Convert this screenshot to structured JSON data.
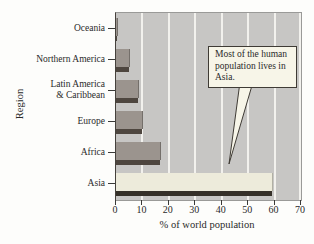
{
  "chart_data": {
    "type": "bar",
    "orientation": "horizontal",
    "title": "",
    "xlabel": "% of world population",
    "ylabel": "Region",
    "xlim": [
      0,
      70
    ],
    "xticks": [
      0,
      10,
      20,
      30,
      40,
      50,
      60,
      70
    ],
    "grid": true,
    "legend": false,
    "categories": [
      "Oceania",
      "Northern America",
      "Latin America\n& Caribbean",
      "Europe",
      "Africa",
      "Asia"
    ],
    "values": [
      0.5,
      5,
      8.5,
      10,
      16.5,
      59
    ],
    "highlight_category": "Asia",
    "annotation": {
      "text": "Most of the human population lives in Asia.",
      "points_to": "Asia"
    }
  },
  "colors": {
    "page_bg": "#fdfdfb",
    "plot_bg": "#c7c6c4",
    "gridline": "#f2f1ed",
    "bar_face": "#9b948e",
    "bar_shadow": "#4e463f",
    "highlight_bar_face": "#edebdb",
    "highlight_bar_shadow": "#353028",
    "axis_text": "#2a2a2a",
    "callout_bg": "#f7f5e8",
    "callout_border": "#3f3b35"
  }
}
